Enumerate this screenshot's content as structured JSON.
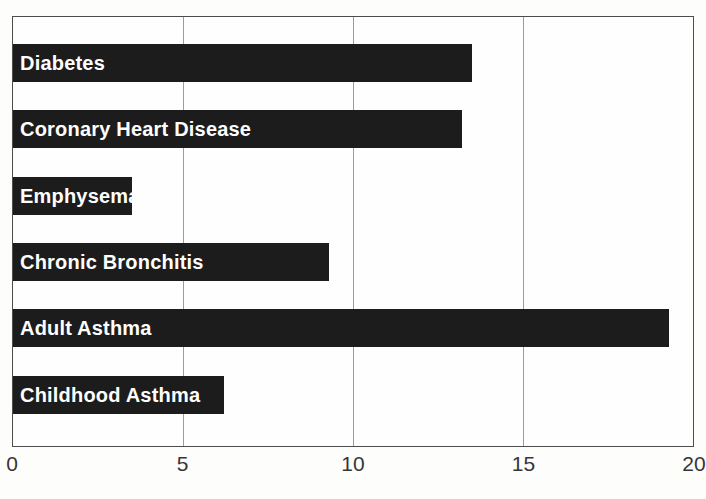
{
  "chart_data": {
    "type": "bar",
    "orientation": "horizontal",
    "title": "",
    "xlabel": "",
    "ylabel": "",
    "categories": [
      "Diabetes",
      "Coronary Heart Disease",
      "Emphysema",
      "Chronic Bronchitis",
      "Adult Asthma",
      "Childhood Asthma"
    ],
    "values": [
      13.5,
      13.2,
      3.5,
      9.3,
      19.3,
      6.2
    ],
    "xlim": [
      0,
      20
    ],
    "xticks": [
      "0",
      "5",
      "10",
      "15",
      "20"
    ],
    "xtick_values": [
      0,
      5,
      10,
      15,
      20
    ],
    "gridline_values": [
      5,
      10,
      15
    ],
    "grid": true,
    "legend": false,
    "label_position": "inside-left",
    "colors": {
      "bar": "#1c1c1c",
      "bar_label": "#ffffff",
      "gridline": "#9c9c9c",
      "plot_border": "#4d4d4d",
      "tick_label": "#363636",
      "background": "#fdfdfb"
    }
  }
}
